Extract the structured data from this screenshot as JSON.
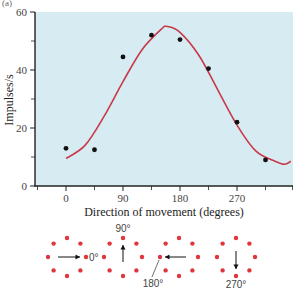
{
  "panel_label": "(a)",
  "colors": {
    "plot_background": "#d6ebf2",
    "curve": "#c83a4a",
    "points": "#111111",
    "axis": "#222222",
    "ring_dots": "#e0353a"
  },
  "chart_data": {
    "type": "scatter",
    "title": "",
    "xlabel": "Direction of movement (degrees)",
    "ylabel": "Impulses/s",
    "xlim": [
      -45,
      360
    ],
    "ylim": [
      0,
      60
    ],
    "x_ticks": [
      0,
      90,
      180,
      270
    ],
    "x_minor_ticks": [
      -45,
      45,
      135,
      225,
      315,
      360
    ],
    "y_ticks": [
      0,
      20,
      40,
      60
    ],
    "y_minor_ticks": [
      10,
      30,
      50
    ],
    "grid": false,
    "legend": null,
    "series": [
      {
        "name": "Observed firing rate",
        "type": "scatter",
        "x": [
          0,
          45,
          90,
          135,
          180,
          225,
          270,
          315
        ],
        "y": [
          13,
          12.5,
          44.5,
          52,
          50.5,
          40.5,
          22,
          9
        ]
      },
      {
        "name": "Fitted tuning curve",
        "type": "line",
        "x": [
          0,
          30,
          60,
          90,
          120,
          150,
          160,
          180,
          210,
          240,
          270,
          300,
          330,
          345,
          355
        ],
        "y": [
          9.5,
          14,
          24,
          36,
          47,
          54,
          55,
          53,
          45,
          33,
          21,
          12,
          8.5,
          7.5,
          8.5
        ]
      }
    ]
  },
  "diagram": {
    "rings": [
      {
        "direction": "0°",
        "label": "0°",
        "arrow": "right"
      },
      {
        "direction": "90°",
        "label": "90°",
        "arrow": "up"
      },
      {
        "direction": "180°",
        "label": "180°",
        "arrow": "left"
      },
      {
        "direction": "270°",
        "label": "270°",
        "arrow": "down"
      }
    ]
  },
  "axis_text": {
    "y_tick_0": "0",
    "y_tick_20": "20",
    "y_tick_40": "40",
    "y_tick_60": "60",
    "x_tick_0": "0",
    "x_tick_90": "90",
    "x_tick_180": "180",
    "x_tick_270": "270"
  }
}
